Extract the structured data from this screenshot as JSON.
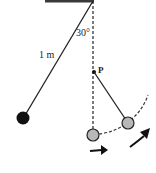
{
  "diagram": {
    "labels": {
      "angle": "30°",
      "length": "1 m",
      "peg": "P"
    },
    "colors": {
      "ceiling": "#3a3a3a",
      "string": "#222222",
      "initial_bob": "#111111",
      "moving_bob": "#b8b8b8",
      "dashed": "#333333",
      "arrow": "#111111"
    },
    "elements": [
      "ceiling support",
      "vertical dashed reference line",
      "string at 30° to vertical with bob (initial position)",
      "peg P on vertical line",
      "bob at lowest point",
      "bob swinging about P",
      "dashed arc path",
      "motion arrows"
    ]
  }
}
